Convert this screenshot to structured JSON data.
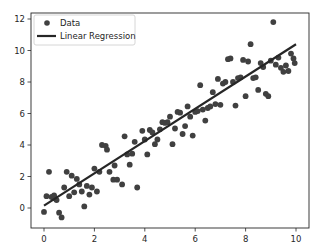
{
  "chart_data": {
    "type": "scatter",
    "title": "",
    "xlabel": "",
    "ylabel": "",
    "xlim": [
      -0.5,
      10.5
    ],
    "ylim": [
      -1.35,
      12.4
    ],
    "x_ticks": [
      0,
      2,
      4,
      6,
      8,
      10
    ],
    "y_ticks": [
      0,
      2,
      4,
      6,
      8,
      10,
      12
    ],
    "grid": false,
    "legend_position": "upper left",
    "colors": {
      "data": "#404040",
      "line": "#262626",
      "axes": "#262626"
    },
    "series": [
      {
        "name": "Data",
        "kind": "scatter",
        "points": [
          [
            0.0,
            -0.25
          ],
          [
            0.1,
            0.75
          ],
          [
            0.2,
            2.3
          ],
          [
            0.3,
            0.7
          ],
          [
            0.4,
            0.8
          ],
          [
            0.45,
            0.6
          ],
          [
            0.5,
            0.5
          ],
          [
            0.6,
            -0.3
          ],
          [
            0.7,
            -0.6
          ],
          [
            0.8,
            1.3
          ],
          [
            0.9,
            2.3
          ],
          [
            1.0,
            0.75
          ],
          [
            1.1,
            2.05
          ],
          [
            1.2,
            1.0
          ],
          [
            1.3,
            1.85
          ],
          [
            1.4,
            1.5
          ],
          [
            1.5,
            1.05
          ],
          [
            1.6,
            0.1
          ],
          [
            1.7,
            1.4
          ],
          [
            1.8,
            0.85
          ],
          [
            1.9,
            1.3
          ],
          [
            2.0,
            2.5
          ],
          [
            2.1,
            1.05
          ],
          [
            2.2,
            2.3
          ],
          [
            2.3,
            4.0
          ],
          [
            2.45,
            3.95
          ],
          [
            2.5,
            3.7
          ],
          [
            2.6,
            2.3
          ],
          [
            2.75,
            1.8
          ],
          [
            2.8,
            2.7
          ],
          [
            2.9,
            1.8
          ],
          [
            3.1,
            1.5
          ],
          [
            3.2,
            4.55
          ],
          [
            3.3,
            3.4
          ],
          [
            3.4,
            2.75
          ],
          [
            3.5,
            3.45
          ],
          [
            3.6,
            4.2
          ],
          [
            3.7,
            1.3
          ],
          [
            3.9,
            4.9
          ],
          [
            4.0,
            4.35
          ],
          [
            4.1,
            3.4
          ],
          [
            4.2,
            4.95
          ],
          [
            4.3,
            4.8
          ],
          [
            4.4,
            4.05
          ],
          [
            4.5,
            4.35
          ],
          [
            4.6,
            5.0
          ],
          [
            4.7,
            5.45
          ],
          [
            4.8,
            5.4
          ],
          [
            4.9,
            5.45
          ],
          [
            5.0,
            5.8
          ],
          [
            5.1,
            4.05
          ],
          [
            5.2,
            5.05
          ],
          [
            5.3,
            6.1
          ],
          [
            5.4,
            6.05
          ],
          [
            5.5,
            4.7
          ],
          [
            5.6,
            5.2
          ],
          [
            5.7,
            6.45
          ],
          [
            5.8,
            5.8
          ],
          [
            5.9,
            4.6
          ],
          [
            6.0,
            6.1
          ],
          [
            6.1,
            6.15
          ],
          [
            6.2,
            7.8
          ],
          [
            6.3,
            6.25
          ],
          [
            6.4,
            5.55
          ],
          [
            6.5,
            6.35
          ],
          [
            6.6,
            6.45
          ],
          [
            6.7,
            7.35
          ],
          [
            6.8,
            6.6
          ],
          [
            6.9,
            8.2
          ],
          [
            7.0,
            6.55
          ],
          [
            7.1,
            7.9
          ],
          [
            7.2,
            8.0
          ],
          [
            7.3,
            9.45
          ],
          [
            7.4,
            9.5
          ],
          [
            7.5,
            8.0
          ],
          [
            7.6,
            6.5
          ],
          [
            7.7,
            8.25
          ],
          [
            7.8,
            8.3
          ],
          [
            7.9,
            9.4
          ],
          [
            8.0,
            7.1
          ],
          [
            8.1,
            9.3
          ],
          [
            8.2,
            10.4
          ],
          [
            8.3,
            8.25
          ],
          [
            8.4,
            8.3
          ],
          [
            8.5,
            7.5
          ],
          [
            8.6,
            9.2
          ],
          [
            8.7,
            8.95
          ],
          [
            8.8,
            7.25
          ],
          [
            8.9,
            7.1
          ],
          [
            9.0,
            9.35
          ],
          [
            9.1,
            11.8
          ],
          [
            9.2,
            9.1
          ],
          [
            9.3,
            9.55
          ],
          [
            9.4,
            8.9
          ],
          [
            9.5,
            8.65
          ],
          [
            9.6,
            9.05
          ],
          [
            9.7,
            8.7
          ],
          [
            9.8,
            9.8
          ],
          [
            9.9,
            9.5
          ],
          [
            9.95,
            9.2
          ]
        ]
      },
      {
        "name": "Linear Regression",
        "kind": "line",
        "points": [
          [
            0.0,
            0.15
          ],
          [
            10.0,
            10.4
          ]
        ]
      }
    ]
  },
  "legend": {
    "items": [
      {
        "label": "Data",
        "marker": "circle"
      },
      {
        "label": "Linear Regression",
        "marker": "line"
      }
    ]
  },
  "axes": {
    "x_tick_labels": [
      "0",
      "2",
      "4",
      "6",
      "8",
      "10"
    ],
    "y_tick_labels": [
      "0",
      "2",
      "4",
      "6",
      "8",
      "10",
      "12"
    ]
  }
}
